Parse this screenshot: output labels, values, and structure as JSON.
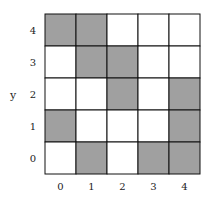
{
  "chart_data": {
    "type": "heatmap",
    "title": "",
    "xlabel": "",
    "ylabel": "y",
    "x_ticks": [
      "0",
      "1",
      "2",
      "3",
      "4"
    ],
    "y_ticks": [
      "0",
      "1",
      "2",
      "3",
      "4"
    ],
    "cells": [
      {
        "x": 0,
        "y": 4,
        "filled": true
      },
      {
        "x": 1,
        "y": 4,
        "filled": true
      },
      {
        "x": 2,
        "y": 4,
        "filled": false
      },
      {
        "x": 3,
        "y": 4,
        "filled": false
      },
      {
        "x": 4,
        "y": 4,
        "filled": false
      },
      {
        "x": 0,
        "y": 3,
        "filled": false
      },
      {
        "x": 1,
        "y": 3,
        "filled": true
      },
      {
        "x": 2,
        "y": 3,
        "filled": true
      },
      {
        "x": 3,
        "y": 3,
        "filled": false
      },
      {
        "x": 4,
        "y": 3,
        "filled": false
      },
      {
        "x": 0,
        "y": 2,
        "filled": false
      },
      {
        "x": 1,
        "y": 2,
        "filled": false
      },
      {
        "x": 2,
        "y": 2,
        "filled": true
      },
      {
        "x": 3,
        "y": 2,
        "filled": false
      },
      {
        "x": 4,
        "y": 2,
        "filled": true
      },
      {
        "x": 0,
        "y": 1,
        "filled": true
      },
      {
        "x": 1,
        "y": 1,
        "filled": false
      },
      {
        "x": 2,
        "y": 1,
        "filled": false
      },
      {
        "x": 3,
        "y": 1,
        "filled": false
      },
      {
        "x": 4,
        "y": 1,
        "filled": true
      },
      {
        "x": 0,
        "y": 0,
        "filled": false
      },
      {
        "x": 1,
        "y": 0,
        "filled": true
      },
      {
        "x": 2,
        "y": 0,
        "filled": false
      },
      {
        "x": 3,
        "y": 0,
        "filled": true
      },
      {
        "x": 4,
        "y": 0,
        "filled": true
      }
    ],
    "colors": {
      "filled": "#a0a0a0",
      "empty": "#ffffff",
      "grid": "#111111"
    },
    "grid": true,
    "legend": "none"
  }
}
